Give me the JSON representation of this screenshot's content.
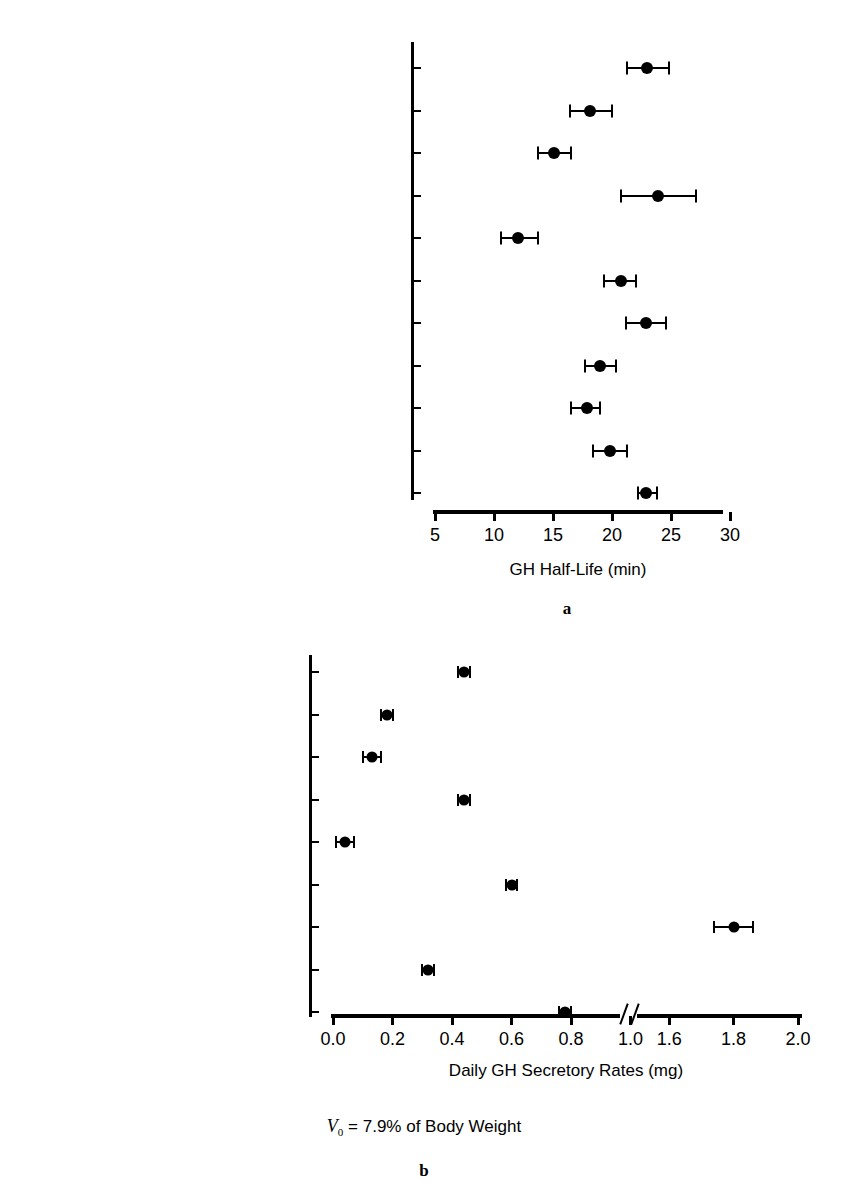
{
  "figure": {
    "footnote": {
      "variable": "V",
      "subscript": "0",
      "text": " = 7.9% of Body Weight"
    }
  },
  "panel_a": {
    "letter": "a",
    "xlabel": "GH Half-Life (min)",
    "xticks": [
      "5",
      "10",
      "15",
      "20",
      "25",
      "30"
    ],
    "categories": [
      "Normal Young Men",
      "Normal Middle-Aged Men",
      "Normal Older Men",
      "Hyperthyroid Middle-Aged Men",
      "Obese Middle-Aged Men",
      "Prepubertal Boys",
      "Late Pubertal Boys",
      "Girls With Turner’s (−E2)",
      "Girls With Turner’s (+E2)",
      "Pubertal Delay (−T)",
      "Pubertal Delay (+T)"
    ]
  },
  "panel_b": {
    "letter": "b",
    "xlabel": "Daily GH Secretory Rates (mg)",
    "xticks_left": [
      "0.0",
      "0.2",
      "0.4",
      "0.6",
      "0.8",
      "1.0"
    ],
    "xticks_right": [
      "1.6",
      "1.8",
      "2.0"
    ],
    "categories": [
      "Normal Young Men",
      "Normal Middle-Aged Men",
      "Normal Older Men",
      "Hyperthyroid Middle-Aged Men",
      "Obese Middle-Aged Men",
      "Prepubertal Boys",
      "Late Pubertal Boys",
      "Pubertal Delay (−T)",
      "Pubertal Delay (+T)"
    ]
  },
  "chart_data": [
    {
      "type": "scatter",
      "panel": "a",
      "title": "",
      "xlabel": "GH Half-Life (min)",
      "ylabel": "",
      "orientation": "horizontal",
      "xlim": [
        5,
        30
      ],
      "xticks": [
        5,
        10,
        15,
        20,
        25,
        30
      ],
      "grid": false,
      "legend": "none",
      "error_bars": "horizontal (SEM)",
      "categories": [
        "Normal Young Men",
        "Normal Middle-Aged Men",
        "Normal Older Men",
        "Hyperthyroid Middle-Aged Men",
        "Obese Middle-Aged Men",
        "Prepubertal Boys",
        "Late Pubertal Boys",
        "Girls With Turner’s (−E2)",
        "Girls With Turner’s (+E2)",
        "Pubertal Delay (−T)",
        "Pubertal Delay (+T)"
      ],
      "values": [
        23.0,
        18.1,
        15.1,
        23.9,
        12.0,
        20.8,
        22.9,
        19.0,
        17.9,
        19.8,
        22.9
      ],
      "err_low": [
        21.3,
        16.4,
        13.7,
        20.8,
        10.6,
        19.3,
        21.2,
        17.7,
        16.5,
        18.4,
        22.2
      ],
      "err_high": [
        24.8,
        20.0,
        16.5,
        27.1,
        13.7,
        22.0,
        24.6,
        20.3,
        19.0,
        21.3,
        23.8
      ]
    },
    {
      "type": "scatter",
      "panel": "b",
      "title": "",
      "xlabel": "Daily GH Secretory Rates (mg)",
      "ylabel": "",
      "orientation": "horizontal",
      "xlim": [
        0.0,
        2.0
      ],
      "axis_break": [
        1.1,
        1.5
      ],
      "xticks": [
        0.0,
        0.2,
        0.4,
        0.6,
        0.8,
        1.0,
        1.6,
        1.8,
        2.0
      ],
      "grid": false,
      "legend": "none",
      "error_bars": "horizontal (SEM)",
      "categories": [
        "Normal Young Men",
        "Normal Middle-Aged Men",
        "Normal Older Men",
        "Hyperthyroid Middle-Aged Men",
        "Obese Middle-Aged Men",
        "Prepubertal Boys",
        "Late Pubertal Boys",
        "Pubertal Delay (−T)",
        "Pubertal Delay (+T)"
      ],
      "values": [
        0.44,
        0.18,
        0.13,
        0.44,
        0.04,
        0.6,
        1.8,
        0.32,
        0.78
      ],
      "err_low": [
        0.42,
        0.16,
        0.1,
        0.42,
        0.01,
        0.58,
        1.74,
        0.3,
        0.76
      ],
      "err_high": [
        0.46,
        0.2,
        0.16,
        0.46,
        0.07,
        0.62,
        1.86,
        0.34,
        0.8
      ]
    }
  ]
}
